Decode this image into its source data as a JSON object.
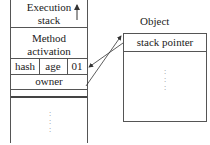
{
  "diagram": {
    "stack": {
      "header_line1": "Execution",
      "header_line2": "stack",
      "method_line1": "Method",
      "method_line2": "activation",
      "fields": [
        "hash",
        "age",
        "01"
      ],
      "owner": "owner",
      "ellipsis": ":"
    },
    "object": {
      "title": "Object",
      "field": "stack pointer",
      "ellipsis": ":"
    },
    "arrows": [
      {
        "from": "owner",
        "to": "object.stack pointer",
        "description": "owner field points to Object"
      },
      {
        "from": "object.stack pointer",
        "to": "stack.01 cell",
        "description": "stack pointer points back to lock record"
      }
    ]
  }
}
